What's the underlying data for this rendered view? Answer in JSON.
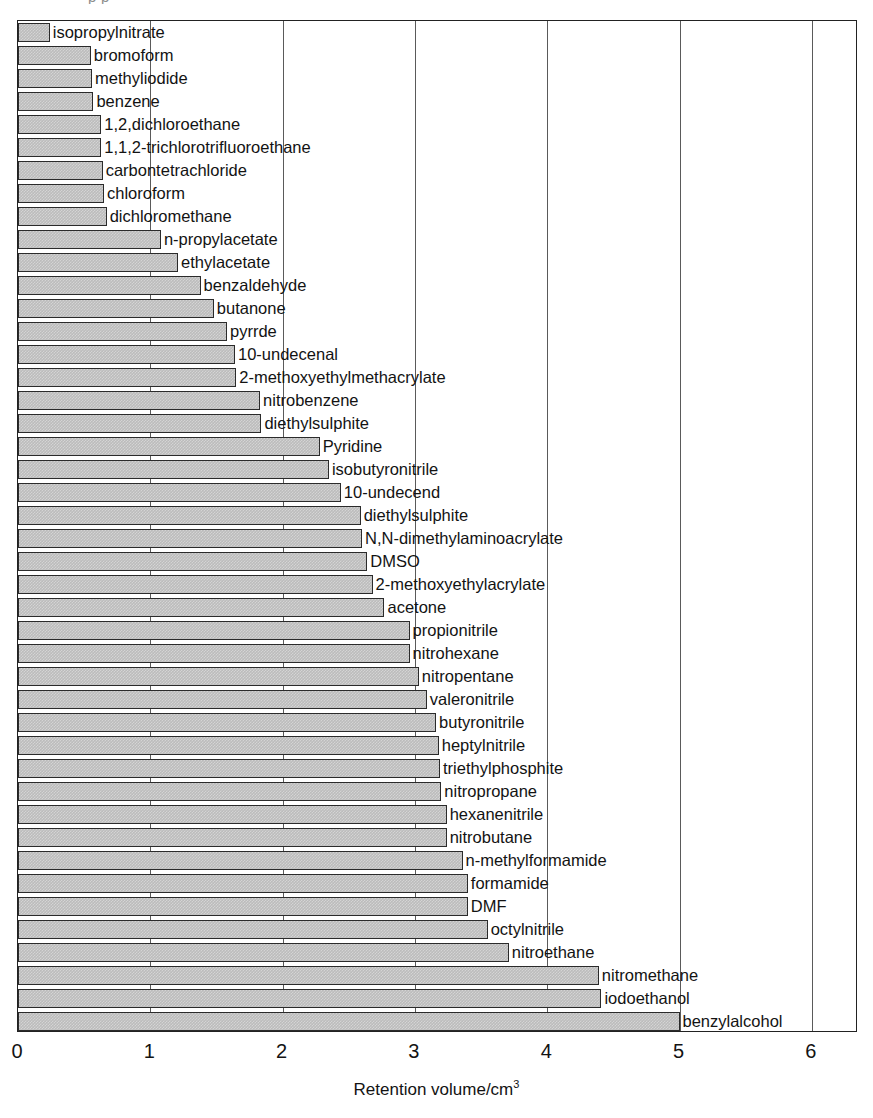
{
  "figure": {
    "clipped_top_text": "p p",
    "xlabel_main": "Retention volume/cm",
    "xlabel_sup": "3",
    "bar_fill_color": "#bcbcbc",
    "bar_border_color": "#2b2b2b",
    "axis_color": "#222222",
    "gridline_color": "#5a5a5a"
  },
  "chart_data": {
    "type": "bar",
    "orientation": "horizontal",
    "title": "",
    "xlabel": "Retention volume/cm3",
    "ylabel": "",
    "xlim": [
      0,
      6.35
    ],
    "xticks": [
      0,
      1,
      2,
      3,
      4,
      5,
      6
    ],
    "xtick_labels": [
      "0",
      "1",
      "2",
      "3",
      "4",
      "5",
      "6"
    ],
    "grid": true,
    "grid_axis": "x",
    "legend": false,
    "units": "cm3",
    "categories": [
      "isopropylnitrate",
      "bromoform",
      "methyliodide",
      "benzene",
      "1,2,dichloroethane",
      "1,1,2-trichlorotrifluoroethane",
      "carbontetrachloride",
      "chloroform",
      "dichloromethane",
      "n-propylacetate",
      "ethylacetate",
      "benzaldehyde",
      "butanone",
      "pyrrde",
      "10-undecenal",
      "2-methoxyethylmethacrylate",
      "nitrobenzene",
      "diethylsulphite",
      "Pyridine",
      "isobutyronitrile",
      "10-undecend",
      "diethylsulphite",
      "N,N-dimethylaminoacrylate",
      "DMSO",
      "2-methoxyethylacrylate",
      "acetone",
      "propionitrile",
      "nitrohexane",
      "nitropentane",
      "valeronitrile",
      "butyronitrile",
      "heptylnitrile",
      "triethylphosphite",
      "nitropropane",
      "hexanenitrile",
      "nitrobutane",
      "n-methylformamide",
      "formamide",
      "DMF",
      "octylnitrile",
      "nitroethane",
      "nitromethane",
      "iodoethanol",
      "benzylalcohol"
    ],
    "values": [
      0.24,
      0.55,
      0.56,
      0.57,
      0.63,
      0.63,
      0.64,
      0.65,
      0.67,
      1.08,
      1.21,
      1.38,
      1.48,
      1.58,
      1.64,
      1.65,
      1.83,
      1.84,
      2.28,
      2.35,
      2.44,
      2.59,
      2.6,
      2.64,
      2.68,
      2.77,
      2.96,
      2.96,
      3.03,
      3.09,
      3.16,
      3.18,
      3.19,
      3.2,
      3.24,
      3.24,
      3.36,
      3.4,
      3.4,
      3.55,
      3.71,
      4.39,
      4.41,
      5.0
    ]
  }
}
